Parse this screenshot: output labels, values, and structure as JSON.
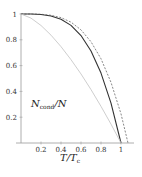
{
  "chart_data": {
    "type": "line",
    "title": "",
    "xlabel": "T/T_c",
    "ylabel": "N_cond/N",
    "xlim": [
      0,
      1.1
    ],
    "ylim": [
      0,
      1
    ],
    "grid": false,
    "legend": null,
    "x_ticks": [
      "0.2",
      "0.4",
      "0.6",
      "0.8",
      "1"
    ],
    "y_ticks": [
      "0.2",
      "0.4",
      "0.6",
      "0.8",
      "1"
    ],
    "series": [
      {
        "name": "solid-dark",
        "style": "solid",
        "color": "#333333",
        "x": [
          0,
          0.1,
          0.2,
          0.3,
          0.4,
          0.5,
          0.6,
          0.7,
          0.8,
          0.9,
          1.0
        ],
        "y": [
          1.0,
          1.0,
          0.996,
          0.985,
          0.959,
          0.912,
          0.833,
          0.713,
          0.542,
          0.309,
          0.0
        ]
      },
      {
        "name": "dashed",
        "style": "dashed",
        "color": "#555555",
        "x": [
          0,
          0.1,
          0.2,
          0.3,
          0.4,
          0.5,
          0.6,
          0.7,
          0.8,
          0.9,
          1.0,
          1.07
        ],
        "y": [
          1.0,
          1.0,
          0.998,
          0.99,
          0.972,
          0.937,
          0.877,
          0.785,
          0.653,
          0.47,
          0.226,
          0.0
        ]
      },
      {
        "name": "solid-light",
        "style": "solid",
        "color": "#c8c8c8",
        "x": [
          0,
          0.1,
          0.2,
          0.3,
          0.4,
          0.5,
          0.6,
          0.7,
          0.8,
          0.9,
          1.0
        ],
        "y": [
          1.0,
          0.968,
          0.911,
          0.836,
          0.747,
          0.646,
          0.535,
          0.414,
          0.284,
          0.146,
          0.0
        ]
      }
    ]
  },
  "labels": {
    "ylabel_main": "N",
    "ylabel_sub": "cond",
    "ylabel_tail": "/N",
    "xlabel_main": "T/T",
    "xlabel_sub": "c"
  }
}
